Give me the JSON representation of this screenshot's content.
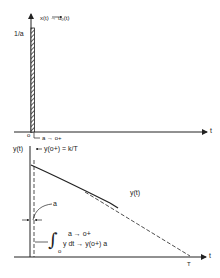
{
  "top_plot": {
    "y_axis_label": "1/a",
    "signal_label": "x(t) → u₀(t)",
    "origin_label": "o",
    "pulse_end_label": "a → o+",
    "x_axis_label": "t",
    "pulse_height": "1/a",
    "pulse_width": "a"
  },
  "bottom_plot": {
    "y_axis_label": "y(t)",
    "initial_value_label": "y(o+) = k/T",
    "curve_label": "y(t)",
    "width_label": "a",
    "limit_label": "a → o+",
    "integral_lower": "o",
    "integral_upper": "a",
    "integral_expr": "y dt → y(o+) a",
    "x_axis_end_label": "T",
    "x_axis_label": "t"
  }
}
